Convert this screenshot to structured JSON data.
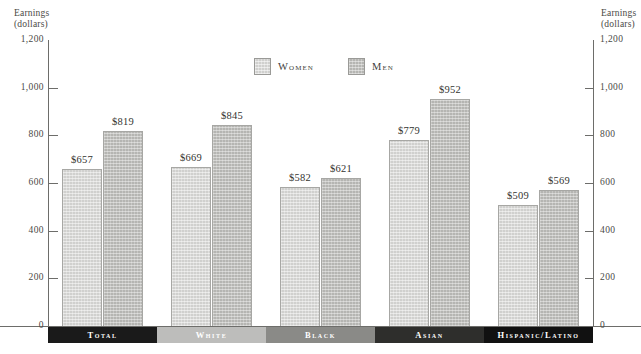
{
  "axis": {
    "left_title": "Earnings\n(dollars)",
    "right_title": "Earnings\n(dollars)",
    "ticks": [
      "1,200",
      "1,000",
      "800",
      "600",
      "400",
      "200",
      "0"
    ]
  },
  "legend": {
    "items": [
      {
        "label": "Women",
        "color": "#d0d0ce"
      },
      {
        "label": "Men",
        "color": "#b5b5b2"
      }
    ]
  },
  "groups": [
    {
      "label": "Total",
      "band_color": "#1a1a1a",
      "women_label": "$657",
      "men_label": "$819"
    },
    {
      "label": "White",
      "band_color": "#bdbdbb",
      "women_label": "$669",
      "men_label": "$845"
    },
    {
      "label": "Black",
      "band_color": "#8a8a87",
      "women_label": "$582",
      "men_label": "$621"
    },
    {
      "label": "Asian",
      "band_color": "#2e2e2c",
      "women_label": "$779",
      "men_label": "$952"
    },
    {
      "label": "Hispanic/Latino",
      "band_color": "#111111",
      "women_label": "$509",
      "men_label": "$569"
    }
  ],
  "chart_data": {
    "type": "bar",
    "title": "",
    "xlabel": "",
    "ylabel": "Earnings (dollars)",
    "ylim": [
      0,
      1200
    ],
    "yticks": [
      0,
      200,
      400,
      600,
      800,
      1000,
      1200
    ],
    "grid": false,
    "legend_position": "top-center",
    "categories": [
      "Total",
      "White",
      "Black",
      "Asian",
      "Hispanic/Latino"
    ],
    "series": [
      {
        "name": "Women",
        "color": "#d0d0ce",
        "values": [
          657,
          669,
          582,
          779,
          509
        ]
      },
      {
        "name": "Men",
        "color": "#b5b5b2",
        "values": [
          819,
          845,
          621,
          952,
          569
        ]
      }
    ],
    "value_labels": {
      "Women": [
        "$657",
        "$669",
        "$582",
        "$779",
        "$509"
      ],
      "Men": [
        "$819",
        "$845",
        "$621",
        "$952",
        "$569"
      ]
    }
  }
}
